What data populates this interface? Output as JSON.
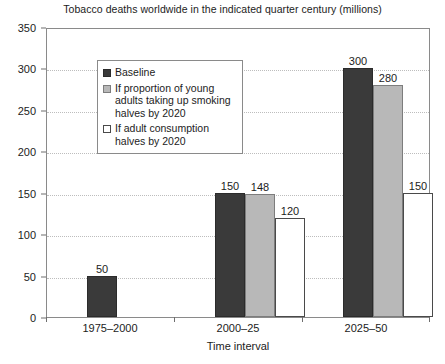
{
  "chart_data": {
    "type": "bar",
    "title": "Tobacco deaths worldwide in the indicated quarter century (millions)",
    "xlabel": "Time interval",
    "ylabel": "",
    "ylim": [
      0,
      350
    ],
    "yticks": [
      0,
      50,
      100,
      150,
      200,
      250,
      300,
      350
    ],
    "ytick_labels": [
      "0",
      "50",
      "100",
      "150",
      "200",
      "250",
      "300",
      "350"
    ],
    "grid": true,
    "grid_style": "dotted horizontal",
    "legend_position": "upper left inside plot",
    "categories": [
      "1975–2000",
      "2000–25",
      "2025–50"
    ],
    "series": [
      {
        "name": "Baseline",
        "color": "#3a3a3a",
        "values": [
          50,
          150,
          300
        ],
        "value_labels": [
          "50",
          "150",
          "300"
        ]
      },
      {
        "name": "If proportion of young adults taking up smoking halves by 2020",
        "color": "#b8b8b8",
        "values": [
          null,
          148,
          280
        ],
        "value_labels": [
          "",
          "148",
          "280"
        ]
      },
      {
        "name": "If adult consumption halves by 2020",
        "color": "#ffffff",
        "values": [
          null,
          120,
          150
        ],
        "value_labels": [
          "",
          "120",
          "150"
        ]
      }
    ]
  },
  "legend": {
    "items": [
      {
        "label": "Baseline",
        "swatch": "baseline"
      },
      {
        "label": "If proportion of young adults taking up smoking halves by 2020",
        "swatch": "young-adults"
      },
      {
        "label": "If adult consumption halves by 2020",
        "swatch": "adult-consump"
      }
    ]
  },
  "colors": {
    "baseline": "#3a3a3a",
    "young_adults": "#b8b8b8",
    "adult_consumption": "#ffffff",
    "axis": "#8a8a8a",
    "gridline": "#bdbdbd",
    "text": "#1c1c1c",
    "background": "#ffffff"
  }
}
